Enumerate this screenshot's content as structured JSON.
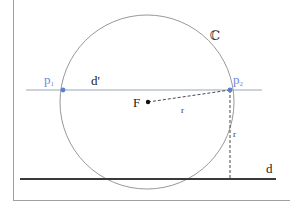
{
  "diagram": {
    "colors": {
      "background": "#ffffff",
      "frame": "#9a9a9a",
      "circle": "#8c8c8c",
      "line_d_prime": "#9aa6b8",
      "line_d": "#3a3a3a",
      "points": "#5b7fd6",
      "point_labels": "#6a8ad8",
      "text": "#222222",
      "dashed": "#333333"
    },
    "labels": {
      "circle": "ℂ",
      "point1": "p",
      "point1_sub": "1",
      "point2": "p",
      "point2_sub": "2",
      "line_secant": "d'",
      "line_directrix": "d",
      "focus": "F",
      "radius_to_p2": "r",
      "distance_to_d": "r"
    },
    "elements": {
      "circle": {
        "cx": 147,
        "cy": 102,
        "r": 87
      },
      "focus": {
        "x": 148,
        "y": 102
      },
      "p1": {
        "x": 63,
        "y": 90
      },
      "p2": {
        "x": 230,
        "y": 90
      },
      "d_prime": {
        "x1": 26,
        "x2": 262,
        "y": 90
      },
      "d": {
        "x1": 20,
        "x2": 276,
        "y": 179
      }
    }
  }
}
